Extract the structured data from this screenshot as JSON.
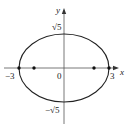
{
  "diagram": {
    "type": "ellipse",
    "equation": "x^2/9 + y^2/5 = 1",
    "axes": {
      "x_label": "x",
      "y_label": "y"
    },
    "labels": {
      "origin": "0",
      "x_neg": "−3",
      "x_pos": "3",
      "y_pos": "√5",
      "y_neg": "−√5"
    },
    "vertices": [
      [
        -3,
        0
      ],
      [
        3,
        0
      ]
    ],
    "foci": [
      [
        -2,
        0
      ],
      [
        2,
        0
      ]
    ],
    "semi_major": 3,
    "semi_minor": "√5",
    "colors": {
      "curve": "#222222",
      "axis": "#555555",
      "points": "#111111"
    }
  }
}
